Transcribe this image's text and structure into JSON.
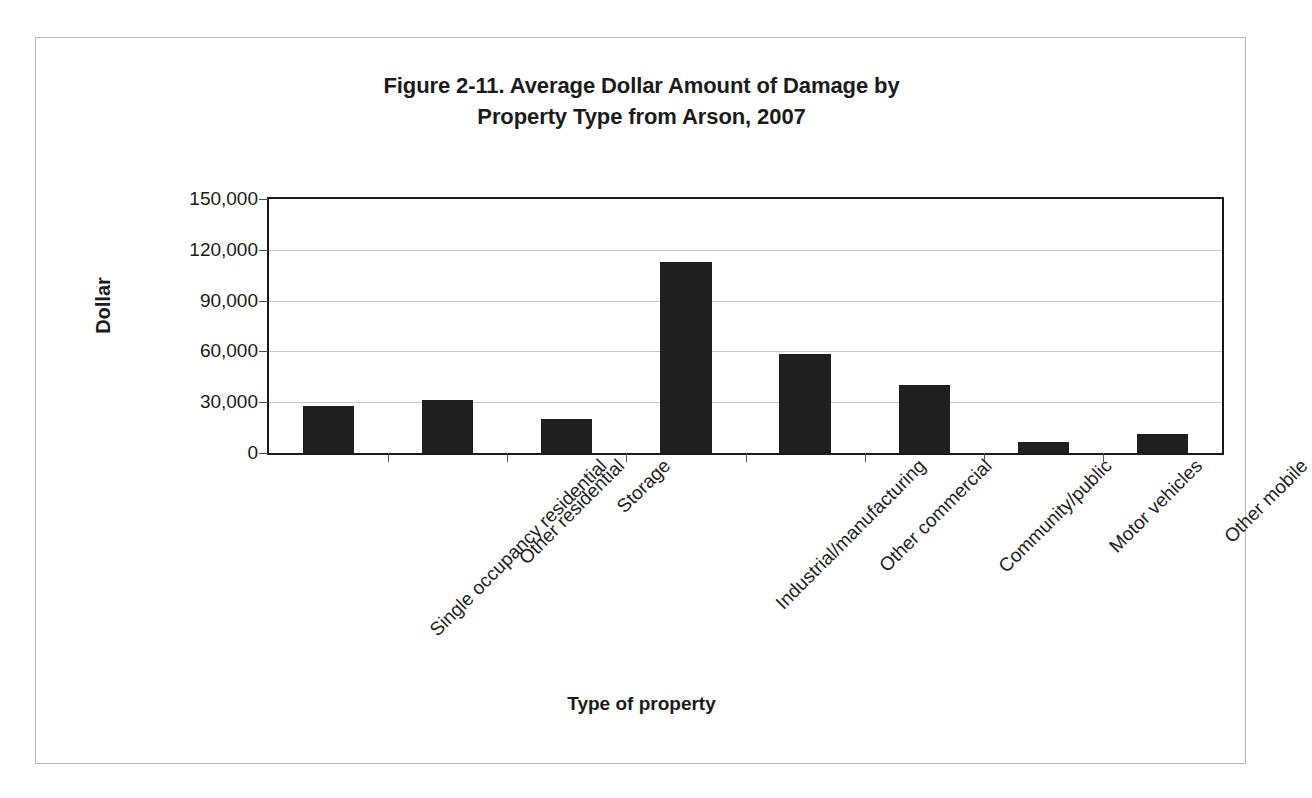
{
  "figure": {
    "title_line1": "Figure 2-11. Average Dollar Amount of Damage by",
    "title_line2": "Property Type from Arson, 2007"
  },
  "chart_data": {
    "type": "bar",
    "title": "Figure 2-11. Average Dollar Amount of Damage by Property Type from Arson, 2007",
    "xlabel": "Type of property",
    "ylabel": "Dollar",
    "ylim": [
      0,
      150000
    ],
    "ytick_labels": [
      "150,000",
      "120,000",
      "90,000",
      "60,000",
      "30,000",
      "0"
    ],
    "ytick_values": [
      150000,
      120000,
      90000,
      60000,
      30000,
      0
    ],
    "grid": true,
    "legend": "none",
    "categories": [
      "Single occupancy residential",
      "Other residential",
      "Storage",
      "Industrial/manufacturing",
      "Other commercial",
      "Community/public",
      "Motor vehicles",
      "Other mobile"
    ],
    "values": [
      28000,
      31500,
      20000,
      113000,
      58500,
      40000,
      6500,
      11000
    ],
    "bar_color": "#1f1f1f"
  }
}
